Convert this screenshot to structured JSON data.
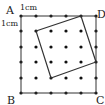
{
  "diagram": {
    "type": "dot-grid-geometry",
    "grid": {
      "cols": 6,
      "rows": 6,
      "unit_label_top": "1cm",
      "unit_label_left": "1cm"
    },
    "outer_square": {
      "labels": {
        "top_left": "A",
        "top_right": "D",
        "bottom_left": "B",
        "bottom_right": "C"
      }
    },
    "inner_square": {
      "vertices_grid": [
        [
          1,
          1
        ],
        [
          4,
          0
        ],
        [
          5,
          3
        ],
        [
          2,
          4
        ]
      ]
    },
    "colors": {
      "line": "#333333",
      "dot": "#111111",
      "background": "#ffffff"
    }
  }
}
